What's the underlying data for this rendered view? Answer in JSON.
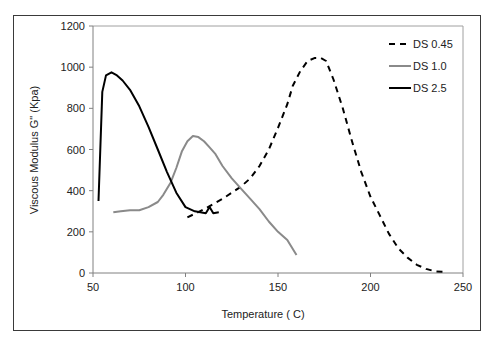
{
  "chart_data": {
    "type": "line",
    "title": "",
    "xlabel": "Temperature ( C)",
    "ylabel": "Viscous Modulus G\" (Kpa)",
    "xlim": [
      50,
      250
    ],
    "ylim": [
      0,
      1200
    ],
    "xticks": [
      50,
      100,
      150,
      200,
      250
    ],
    "yticks": [
      0,
      200,
      400,
      600,
      800,
      1000,
      1200
    ],
    "grid": false,
    "legend_position": "upper right",
    "series": [
      {
        "name": "DS 0.45",
        "style": "dashed",
        "color": "#000000",
        "x": [
          101,
          110,
          120,
          130,
          135,
          140,
          145,
          150,
          155,
          158,
          162,
          166,
          170,
          173,
          176,
          180,
          185,
          190,
          195,
          200,
          205,
          210,
          215,
          220,
          225,
          230,
          235,
          241
        ],
        "y": [
          270,
          310,
          360,
          420,
          460,
          520,
          600,
          705,
          820,
          910,
          980,
          1030,
          1045,
          1045,
          1030,
          940,
          800,
          640,
          490,
          370,
          280,
          190,
          120,
          75,
          40,
          20,
          8,
          5
        ]
      },
      {
        "name": "DS 1.0",
        "style": "solid",
        "color": "#8a8a8a",
        "x": [
          61,
          65,
          70,
          75,
          80,
          85,
          88,
          92,
          95,
          98,
          101,
          104,
          107,
          110,
          113,
          116,
          120,
          125,
          130,
          135,
          140,
          145,
          150,
          155,
          160
        ],
        "y": [
          295,
          300,
          305,
          305,
          320,
          345,
          380,
          440,
          510,
          590,
          640,
          665,
          660,
          640,
          610,
          580,
          520,
          460,
          410,
          360,
          310,
          250,
          200,
          160,
          87
        ]
      },
      {
        "name": "DS 2.5",
        "style": "solid",
        "color": "#000000",
        "x": [
          53,
          55,
          57,
          60,
          63,
          66,
          70,
          75,
          80,
          85,
          90,
          95,
          100,
          105,
          108,
          111,
          113,
          115,
          118
        ],
        "y": [
          350,
          880,
          960,
          975,
          960,
          935,
          890,
          810,
          710,
          600,
          490,
          390,
          320,
          300,
          295,
          290,
          320,
          290,
          295
        ]
      }
    ]
  }
}
